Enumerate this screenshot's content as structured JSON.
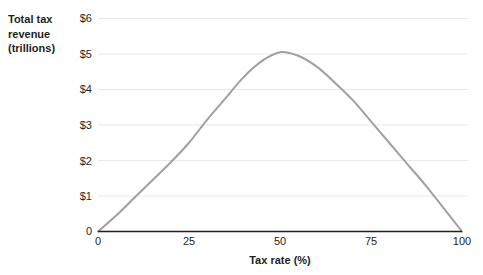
{
  "chart_data": {
    "type": "line",
    "title": "",
    "subtitle": "",
    "xlabel": "Tax rate (%)",
    "ylabel": "Total tax revenue (trillions)",
    "ylabel_lines": [
      "Total tax",
      "revenue",
      "(trillions)"
    ],
    "xlim": [
      0,
      100
    ],
    "ylim": [
      0,
      6
    ],
    "grid": true,
    "grid_axis": "y",
    "legend": false,
    "legend_position": "none",
    "x_ticks": [
      0,
      25,
      50,
      75,
      100
    ],
    "x_tick_labels": [
      "0",
      "25",
      "50",
      "75",
      "100"
    ],
    "y_ticks": [
      0,
      1,
      2,
      3,
      4,
      5,
      6
    ],
    "y_tick_labels": [
      "0",
      "$1",
      "$2",
      "$3",
      "$4",
      "$5",
      "$6"
    ],
    "series": [
      {
        "name": "Laffer curve",
        "color": "#a0a0a0",
        "line_width": 2,
        "x": [
          0,
          5,
          10,
          15,
          20,
          25,
          30,
          35,
          40,
          45,
          50,
          55,
          60,
          65,
          70,
          75,
          80,
          85,
          90,
          95,
          100
        ],
        "y": [
          0.0,
          0.45,
          0.95,
          1.45,
          1.95,
          2.5,
          3.15,
          3.75,
          4.35,
          4.8,
          5.05,
          4.95,
          4.65,
          4.2,
          3.7,
          3.1,
          2.5,
          1.9,
          1.3,
          0.65,
          0.0
        ]
      }
    ],
    "peak": {
      "x": 50,
      "y": 5.05
    },
    "colors": {
      "curve": "#a0a0a0",
      "gridline": "#e9e9e9",
      "axis": "#231f20",
      "text": "#231f20",
      "background": "#ffffff"
    }
  }
}
